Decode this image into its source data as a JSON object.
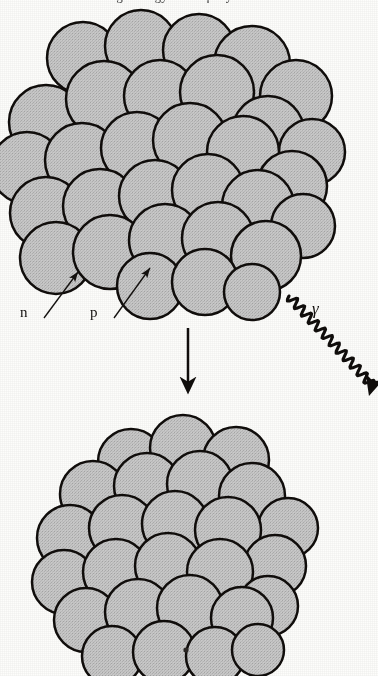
{
  "figure": {
    "title_clipped": "large energy of the γ-ray emitted",
    "background_color": "#fdfdfb",
    "sphere_fill": "#c8c8c8",
    "sphere_stroke": "#100d0b",
    "ink_color": "#14110f"
  },
  "labels": {
    "neutron": "n",
    "proton": "p",
    "gamma": "γ"
  },
  "annotations": [
    {
      "name": "neutron-label",
      "text": "n",
      "x": 20,
      "y": 305
    },
    {
      "name": "proton-label",
      "text": "p",
      "x": 90,
      "y": 305
    },
    {
      "name": "gamma-label",
      "text": "γ",
      "x": 312,
      "y": 300
    }
  ],
  "arrows": {
    "neutron_pointer": {
      "from": [
        44,
        318
      ],
      "to": [
        78,
        272
      ]
    },
    "proton_pointer": {
      "from": [
        114,
        318
      ],
      "to": [
        150,
        268
      ]
    },
    "transition": {
      "from": [
        188,
        328
      ],
      "to": [
        188,
        390
      ],
      "direction": "down"
    },
    "gamma_wave": {
      "from": [
        289,
        296
      ],
      "to": [
        374,
        387
      ],
      "style": "sinusoidal"
    }
  },
  "clusters": {
    "excited_nucleus": {
      "name": "upper-nucleus-cluster",
      "state": "excited",
      "bounds": [
        12,
        18,
        330,
        302
      ],
      "nucleon_count": 31,
      "nucleons": [
        [
          83,
          58,
          36
        ],
        [
          141,
          46,
          36
        ],
        [
          199,
          50,
          36
        ],
        [
          252,
          64,
          38
        ],
        [
          296,
          96,
          36
        ],
        [
          46,
          122,
          37
        ],
        [
          104,
          99,
          38
        ],
        [
          160,
          96,
          36
        ],
        [
          217,
          92,
          37
        ],
        [
          268,
          132,
          36
        ],
        [
          312,
          152,
          33
        ],
        [
          27,
          168,
          36
        ],
        [
          82,
          160,
          37
        ],
        [
          137,
          148,
          36
        ],
        [
          190,
          140,
          37
        ],
        [
          243,
          152,
          36
        ],
        [
          292,
          186,
          35
        ],
        [
          46,
          213,
          36
        ],
        [
          100,
          206,
          37
        ],
        [
          155,
          196,
          36
        ],
        [
          208,
          190,
          36
        ],
        [
          258,
          206,
          36
        ],
        [
          303,
          226,
          32
        ],
        [
          56,
          258,
          36
        ],
        [
          110,
          252,
          37
        ],
        [
          165,
          240,
          36
        ],
        [
          218,
          238,
          36
        ],
        [
          266,
          256,
          35
        ],
        [
          150,
          286,
          33
        ],
        [
          205,
          282,
          33
        ],
        [
          252,
          292,
          28
        ]
      ]
    },
    "relaxed_nucleus": {
      "name": "lower-nucleus-cluster",
      "state": "ground",
      "bounds": [
        53,
        425,
        310,
        672
      ],
      "nucleon_count": 26,
      "nucleons": [
        [
          131,
          462,
          33
        ],
        [
          183,
          448,
          33
        ],
        [
          236,
          460,
          33
        ],
        [
          93,
          494,
          33
        ],
        [
          147,
          486,
          33
        ],
        [
          200,
          484,
          33
        ],
        [
          252,
          496,
          33
        ],
        [
          288,
          528,
          30
        ],
        [
          70,
          538,
          33
        ],
        [
          122,
          528,
          33
        ],
        [
          175,
          524,
          33
        ],
        [
          228,
          530,
          33
        ],
        [
          275,
          566,
          31
        ],
        [
          64,
          582,
          32
        ],
        [
          116,
          572,
          33
        ],
        [
          168,
          566,
          33
        ],
        [
          220,
          572,
          33
        ],
        [
          268,
          606,
          30
        ],
        [
          86,
          620,
          32
        ],
        [
          138,
          612,
          33
        ],
        [
          190,
          608,
          33
        ],
        [
          242,
          618,
          31
        ],
        [
          112,
          656,
          30
        ],
        [
          164,
          652,
          31
        ],
        [
          215,
          656,
          29
        ],
        [
          258,
          650,
          26
        ]
      ]
    }
  },
  "artifacts": [
    {
      "name": "scan-speck",
      "x": 186,
      "y": 650,
      "r": 2.6
    }
  ]
}
